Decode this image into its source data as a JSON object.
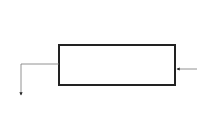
{
  "diagram": {
    "block_label": "4-bit adder",
    "inputs_top": [
      {
        "base": "y",
        "sub": "3"
      },
      {
        "base": "x",
        "sub": "3"
      },
      {
        "base": "y",
        "sub": "2"
      },
      {
        "base": "x",
        "sub": "2"
      },
      {
        "base": "y",
        "sub": "1"
      },
      {
        "base": "x",
        "sub": "1"
      },
      {
        "base": "y",
        "sub": "0"
      },
      {
        "base": "x",
        "sub": "0"
      }
    ],
    "carry_in": {
      "base": "c",
      "sub": "0"
    },
    "carry_out": {
      "base": "c",
      "sub": "4"
    },
    "outputs_bottom": [
      {
        "base": "s",
        "sub": "3"
      },
      {
        "base": "s",
        "sub": "2"
      },
      {
        "base": "s",
        "sub": "1"
      },
      {
        "base": "s",
        "sub": "0"
      }
    ],
    "colors": {
      "block_stroke": "#222222",
      "wire": "#777777",
      "arrow": "#222222"
    }
  }
}
